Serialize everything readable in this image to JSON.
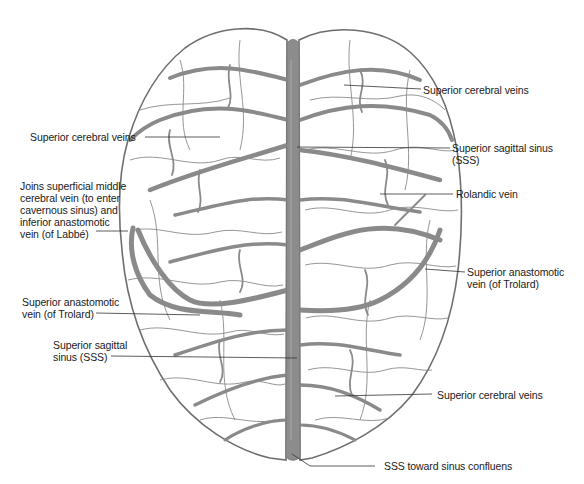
{
  "diagram": {
    "colors": {
      "vein": "#8a8a8a",
      "sinus": "#8c8c8c",
      "outline": "#6e6e6e",
      "leader_line": "#333333",
      "text": "#1a1a1a",
      "background": "#ffffff"
    },
    "labels": [
      {
        "id": "sup-cerebral-veins-top-right",
        "text": "Superior cerebral veins"
      },
      {
        "id": "sup-cerebral-veins-left",
        "text": "Superior cerebral veins"
      },
      {
        "id": "sss-right",
        "text": "Superior sagittal sinus\n(SSS)"
      },
      {
        "id": "rolandic-vein",
        "text": "Rolandic vein"
      },
      {
        "id": "joins-smcv",
        "text": "Joins superficial middle\ncerebral vein (to enter\ncavernous sinus) and\ninferior anastomotic\nvein (of Labbé)"
      },
      {
        "id": "trolard-right",
        "text": "Superior anastomotic\nvein (of Trolard)"
      },
      {
        "id": "trolard-left",
        "text": "Superior anastomotic\nvein (of Trolard)"
      },
      {
        "id": "sss-left",
        "text": "Superior sagittal\nsinus (SSS)"
      },
      {
        "id": "sup-cerebral-veins-bottom-right",
        "text": "Superior cerebral veins"
      },
      {
        "id": "sss-confluens",
        "text": "SSS toward sinus confluens"
      }
    ]
  }
}
